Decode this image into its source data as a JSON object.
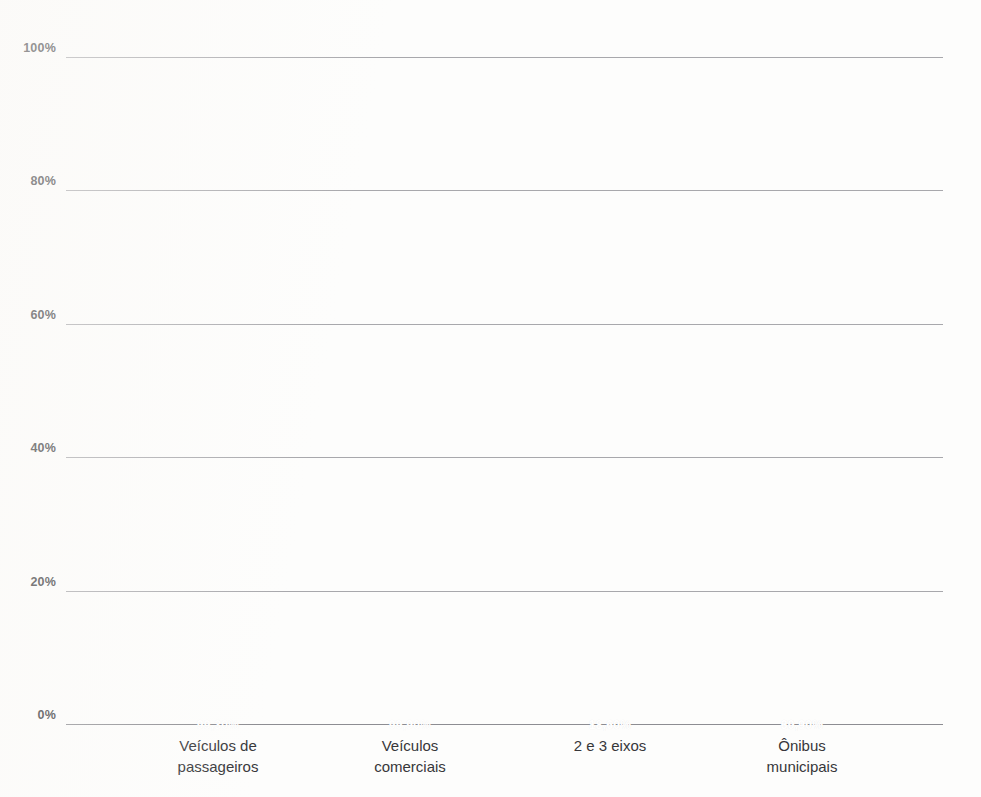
{
  "chart_data": {
    "type": "bar",
    "subtype": "stacked-percentage",
    "title": "",
    "xlabel": "",
    "ylabel": "",
    "ylim": [
      0,
      100
    ],
    "grid": true,
    "legend": "none",
    "categories": [
      "Veículos de\npassageiros",
      "Veículos\ncomerciais",
      "2 e 3 eixos",
      "Ônibus\nmunicipais"
    ],
    "ytick_labels": [
      "0%",
      "20%",
      "40%",
      "60%",
      "80%",
      "100%"
    ],
    "ytick_values": [
      0,
      20,
      40,
      60,
      80,
      100
    ],
    "series": [
      {
        "name": "segmento-inferior",
        "color": "#f4602a",
        "values": [
          0.7,
          0.1,
          18.6,
          30.9
        ],
        "data_labels": [
          "",
          "",
          "18,60%",
          "30,90%"
        ]
      },
      {
        "name": "segmento-superior",
        "color": "#f4927d",
        "values": [
          99.3,
          99.9,
          81.4,
          69.1
        ],
        "data_labels": [
          "99,30%",
          "99,90%",
          "81,40%",
          "69,10%"
        ]
      }
    ]
  },
  "colors": {
    "segment_top": "#f4927d",
    "segment_bottom": "#f4602a",
    "gridline": "#a8a8ac",
    "axis_text": "#333336",
    "label_text": "#ffffff",
    "background": "#fdfdfc"
  }
}
